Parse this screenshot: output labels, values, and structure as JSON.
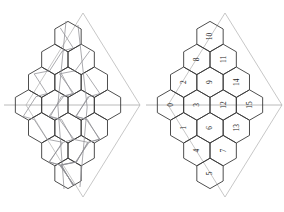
{
  "figure": {
    "panels": [
      {
        "id": "left",
        "name": "unlabeled-tiling-with-paths",
        "has_labels": false,
        "has_paths": true
      },
      {
        "id": "right",
        "name": "numbered-tiling",
        "has_labels": true,
        "has_paths": false
      }
    ],
    "colors": {
      "hex_stroke": "#3a3a3a",
      "frame_stroke": "#b9b9b9",
      "axis_stroke": "#a8a8a8",
      "path_stroke": "#8d8d93",
      "label_fill": "#1d1d1d",
      "background": "#ffffff"
    }
  },
  "chart_data": {
    "type": "diagram",
    "title": "",
    "subtitle": "",
    "xlabel": "",
    "ylabel": "",
    "grid": false,
    "legend": "none",
    "rows": [
      {
        "row": 0,
        "count": 1,
        "labels": [
          "10"
        ]
      },
      {
        "row": 1,
        "count": 2,
        "labels": [
          "8",
          "11"
        ]
      },
      {
        "row": 2,
        "count": 3,
        "labels": [
          "2",
          "9",
          "14"
        ]
      },
      {
        "row": 3,
        "count": 4,
        "labels": [
          "0",
          "3",
          "12",
          "15"
        ]
      },
      {
        "row": 4,
        "count": 3,
        "labels": [
          "1",
          "6",
          "13"
        ]
      },
      {
        "row": 5,
        "count": 2,
        "labels": [
          "4",
          "7"
        ]
      },
      {
        "row": 6,
        "count": 1,
        "labels": [
          "5"
        ]
      }
    ],
    "labels_flat": [
      "10",
      "8",
      "11",
      "2",
      "9",
      "14",
      "0",
      "3",
      "12",
      "15",
      "1",
      "6",
      "13",
      "4",
      "7",
      "5"
    ],
    "label_count": 16,
    "label_rotation_deg": -90,
    "label_min": 0,
    "label_max": 15
  }
}
